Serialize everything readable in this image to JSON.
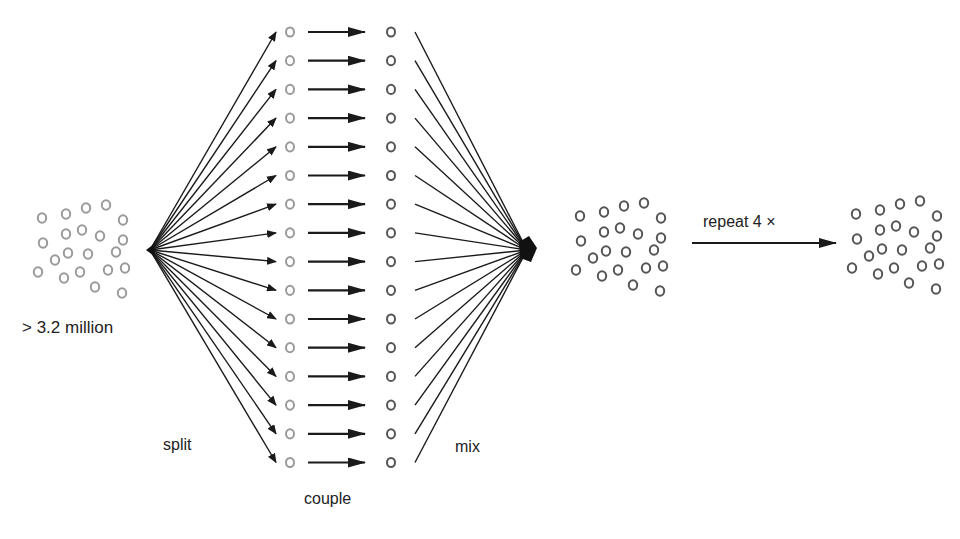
{
  "labels": {
    "pool_size": "> 3.2 million",
    "split": "split",
    "couple": "couple",
    "mix": "mix",
    "repeat": "repeat 4 ×"
  },
  "diagram": {
    "row_count": 16,
    "row_top_y": 32,
    "row_spacing": 28.7,
    "split_origin": [
      150,
      250
    ],
    "mix_target": [
      527,
      250
    ],
    "colors": {
      "bead_light": "#9a9a9a",
      "bead_dark": "#555555",
      "line": "#1a1a1a"
    },
    "pool_beads": [
      [
        42,
        218
      ],
      [
        66,
        214
      ],
      [
        86,
        208
      ],
      [
        106,
        205
      ],
      [
        123,
        220
      ],
      [
        43,
        243
      ],
      [
        66,
        234
      ],
      [
        82,
        230
      ],
      [
        100,
        236
      ],
      [
        123,
        240
      ],
      [
        55,
        260
      ],
      [
        68,
        253
      ],
      [
        88,
        254
      ],
      [
        116,
        252
      ],
      [
        38,
        272
      ],
      [
        64,
        278
      ],
      [
        80,
        272
      ],
      [
        108,
        270
      ],
      [
        125,
        268
      ],
      [
        95,
        287
      ],
      [
        122,
        293
      ]
    ]
  }
}
